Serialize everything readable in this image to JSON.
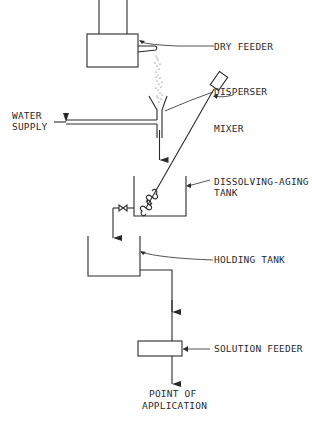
{
  "diagram": {
    "type": "process-flow",
    "components": [
      {
        "id": "dry_feeder",
        "label": "DRY FEEDER"
      },
      {
        "id": "disperser",
        "label": "DISPERSER"
      },
      {
        "id": "water_supply",
        "label_line1": "WATER",
        "label_line2": "SUPPLY"
      },
      {
        "id": "mixer",
        "label": "MIXER"
      },
      {
        "id": "dissolving_tank",
        "label_line1": "DISSOLVING-AGING",
        "label_line2": "TANK"
      },
      {
        "id": "holding_tank",
        "label": "HOLDING TANK"
      },
      {
        "id": "solution_feeder",
        "label": "SOLUTION FEEDER"
      },
      {
        "id": "point_of_application",
        "label_line1": "POINT OF",
        "label_line2": "APPLICATION"
      }
    ],
    "flow": [
      "dry_feeder",
      "disperser",
      "dissolving_tank",
      "holding_tank",
      "solution_feeder",
      "point_of_application"
    ],
    "colors": {
      "line": "#2a2a2a",
      "background": "#ffffff"
    }
  }
}
